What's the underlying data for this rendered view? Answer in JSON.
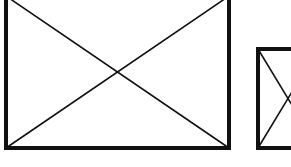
{
  "diagram": {
    "stroke_color": "#111111",
    "background": "#ffffff",
    "shapes": [
      {
        "name": "large-placeholder",
        "x": 6,
        "y": -4,
        "width": 223,
        "height": 152,
        "border_width": 4,
        "diagonal_width": 1.6
      },
      {
        "name": "small-placeholder",
        "x": 258,
        "y": 49,
        "width": 60,
        "height": 99,
        "border_width": 4,
        "diagonal_width": 1.6
      }
    ]
  }
}
